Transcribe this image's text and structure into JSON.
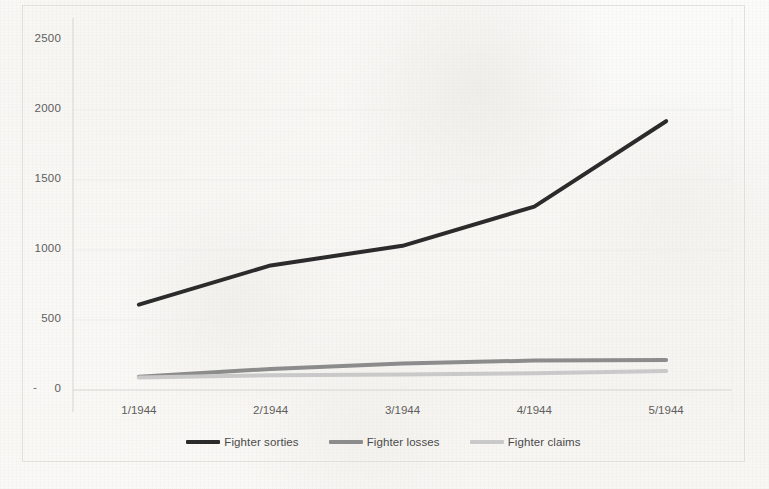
{
  "chart_data": {
    "type": "line",
    "title": "",
    "xlabel": "",
    "ylabel": "",
    "categories": [
      "1/1944",
      "2/1944",
      "3/1944",
      "4/1944",
      "5/1944"
    ],
    "ylim": [
      0,
      2500
    ],
    "yticks": [
      "0",
      "500",
      "1000",
      "1500",
      "2000",
      "2500"
    ],
    "ytick_values": [
      0,
      500,
      1000,
      1500,
      2000,
      2500
    ],
    "zero_tick_prefix": "-",
    "grid": "horizontal",
    "legend_position": "bottom-center",
    "series": [
      {
        "name": "Fighter sorties",
        "color": "#2b2b2b",
        "width": 4,
        "values": [
          610,
          890,
          1030,
          1310,
          1920
        ]
      },
      {
        "name": "Fighter losses",
        "color": "#8c8c8c",
        "width": 4,
        "values": [
          95,
          150,
          190,
          210,
          215
        ]
      },
      {
        "name": "Fighter claims",
        "color": "#c9c9c9",
        "width": 4,
        "values": [
          90,
          105,
          110,
          120,
          135
        ]
      }
    ]
  },
  "colors": {
    "gridline": "#ededea",
    "axis": "#d8d6d1",
    "frame": "#e2e0db",
    "tick_text": "#5d5d5d",
    "legend_text": "#4a4a4a",
    "background": "#fbfaf8"
  }
}
